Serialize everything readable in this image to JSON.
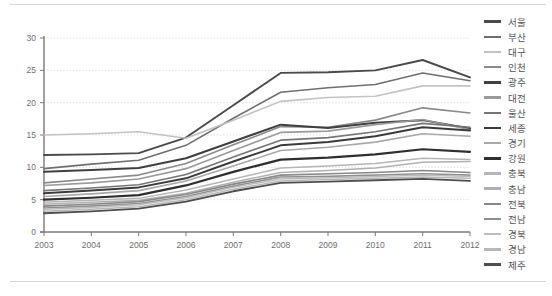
{
  "chart_data": {
    "type": "line",
    "title": "",
    "xlabel": "",
    "ylabel": "",
    "categories": [
      2003,
      2004,
      2005,
      2006,
      2007,
      2008,
      2009,
      2010,
      2011,
      2012
    ],
    "xlim": [
      2003,
      2012
    ],
    "ylim": [
      0,
      30
    ],
    "yticks": [
      0,
      5,
      10,
      15,
      20,
      25,
      30
    ],
    "xticks": [
      "2003",
      "2004",
      "2005",
      "2006",
      "2007",
      "2008",
      "2009",
      "2010",
      "2011",
      "2012"
    ],
    "grid": "horizontal-dotted",
    "legend_position": "right",
    "series": [
      {
        "name": "서울",
        "color": "#4a4a4a",
        "width": 1.9,
        "values": [
          11.9,
          12.0,
          12.2,
          14.6,
          19.6,
          24.6,
          24.7,
          25.0,
          26.6,
          23.9
        ]
      },
      {
        "name": "부산",
        "color": "#6f6f6f",
        "width": 1.6,
        "values": [
          9.8,
          10.5,
          11.1,
          13.4,
          17.6,
          21.6,
          22.3,
          22.8,
          24.6,
          23.4
        ]
      },
      {
        "name": "대구",
        "color": "#c2c2c2",
        "width": 1.6,
        "values": [
          15.0,
          15.2,
          15.5,
          14.5,
          17.3,
          20.2,
          20.8,
          21.0,
          22.6,
          22.6
        ]
      },
      {
        "name": "인천",
        "color": "#8a8a8a",
        "width": 1.6,
        "values": [
          7.6,
          8.2,
          8.8,
          10.6,
          13.5,
          16.3,
          16.2,
          17.3,
          19.2,
          18.4
        ]
      },
      {
        "name": "광주",
        "color": "#3f3f3f",
        "width": 2.0,
        "values": [
          9.3,
          9.6,
          9.9,
          11.4,
          14.0,
          16.6,
          16.1,
          16.9,
          17.3,
          16.0
        ]
      },
      {
        "name": "대전",
        "color": "#9a9a9a",
        "width": 1.6,
        "values": [
          7.2,
          7.6,
          8.2,
          9.8,
          12.6,
          15.4,
          15.6,
          16.6,
          17.4,
          15.8
        ]
      },
      {
        "name": "울산",
        "color": "#767676",
        "width": 1.6,
        "values": [
          6.4,
          6.8,
          7.3,
          8.9,
          11.6,
          14.2,
          14.6,
          15.5,
          16.8,
          16.2
        ]
      },
      {
        "name": "세종",
        "color": "#3b3b3b",
        "width": 2.0,
        "values": [
          6.0,
          6.4,
          6.9,
          8.3,
          10.9,
          13.4,
          13.9,
          14.8,
          16.2,
          15.7
        ]
      },
      {
        "name": "경기",
        "color": "#a8a8a8",
        "width": 1.6,
        "values": [
          5.5,
          5.9,
          6.4,
          7.9,
          10.2,
          12.6,
          13.1,
          13.9,
          15.2,
          14.8
        ]
      },
      {
        "name": "강원",
        "color": "#2f2f2f",
        "width": 2.2,
        "values": [
          5.0,
          5.3,
          5.7,
          7.2,
          9.3,
          11.2,
          11.5,
          12.0,
          12.8,
          12.4
        ]
      },
      {
        "name": "충북",
        "color": "#b5b5b5",
        "width": 1.5,
        "values": [
          4.6,
          4.9,
          5.2,
          6.5,
          8.2,
          9.9,
          10.2,
          10.6,
          11.4,
          11.2
        ]
      },
      {
        "name": "충남",
        "color": "#b0b0b0",
        "width": 1.5,
        "values": [
          4.3,
          4.6,
          4.9,
          6.0,
          7.7,
          9.2,
          9.5,
          9.9,
          10.8,
          10.9
        ]
      },
      {
        "name": "전북",
        "color": "#888888",
        "width": 1.6,
        "values": [
          4.0,
          4.3,
          4.7,
          5.8,
          7.4,
          8.8,
          9.0,
          9.2,
          9.5,
          9.2
        ]
      },
      {
        "name": "전남",
        "color": "#8f8f8f",
        "width": 1.6,
        "values": [
          3.7,
          4.0,
          4.4,
          5.5,
          7.1,
          8.5,
          8.6,
          8.8,
          9.0,
          8.8
        ]
      },
      {
        "name": "경북",
        "color": "#bdbdbd",
        "width": 1.5,
        "values": [
          3.5,
          3.8,
          4.2,
          5.3,
          6.9,
          8.2,
          8.4,
          8.6,
          8.8,
          8.6
        ]
      },
      {
        "name": "경남",
        "color": "#b8b8b8",
        "width": 1.5,
        "values": [
          3.2,
          3.5,
          3.9,
          5.0,
          6.6,
          7.9,
          8.1,
          8.3,
          8.5,
          8.3
        ]
      },
      {
        "name": "제주",
        "color": "#4e4e4e",
        "width": 1.8,
        "values": [
          2.9,
          3.2,
          3.6,
          4.7,
          6.3,
          7.6,
          7.8,
          8.0,
          8.2,
          7.9
        ]
      }
    ]
  },
  "legend": {
    "items": [
      {
        "label": "서울"
      },
      {
        "label": "부산"
      },
      {
        "label": "대구"
      },
      {
        "label": "인천"
      },
      {
        "label": "광주"
      },
      {
        "label": "대전"
      },
      {
        "label": "울산"
      },
      {
        "label": "세종"
      },
      {
        "label": "경기"
      },
      {
        "label": "강원"
      },
      {
        "label": "충북"
      },
      {
        "label": "충남"
      },
      {
        "label": "전북"
      },
      {
        "label": "전남"
      },
      {
        "label": "경북"
      },
      {
        "label": "경남"
      },
      {
        "label": "제주"
      }
    ]
  },
  "style": {
    "axis_color": "#7a7a7a",
    "grid_color": "#d6d6d6",
    "tick_text_color": "#6e6e6e",
    "background": "#ffffff"
  }
}
